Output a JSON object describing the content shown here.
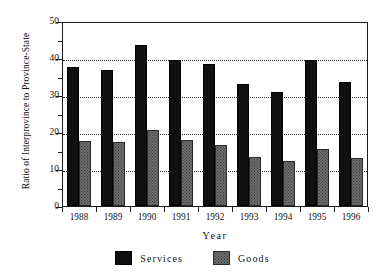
{
  "chart_data": {
    "type": "bar",
    "title": "",
    "xlabel": "Year",
    "ylabel": "Ratio of Interprovince to Province-State",
    "categories": [
      "1988",
      "1989",
      "1990",
      "1991",
      "1992",
      "1993",
      "1994",
      "1995",
      "1996"
    ],
    "series": [
      {
        "name": "Services",
        "color": "#101010",
        "values": [
          37.7,
          36.7,
          43.4,
          39.5,
          38.3,
          33.1,
          30.8,
          39.4,
          33.5
        ]
      },
      {
        "name": "Goods",
        "color": "#6d6d6d",
        "values": [
          17.6,
          17.3,
          20.5,
          17.8,
          16.4,
          13.3,
          12.3,
          15.4,
          12.9
        ]
      }
    ],
    "ylim": [
      0,
      50
    ],
    "yticks": [
      0,
      10,
      20,
      30,
      40,
      50
    ],
    "ytick_labels": [
      "0",
      "10",
      "20",
      "30",
      "40",
      "50"
    ],
    "yminor_ticks": [
      5,
      15,
      25,
      35,
      45
    ],
    "gridlines": [
      10,
      20,
      30,
      40
    ],
    "grid": true,
    "grid_style": "dotted",
    "legend_position": "bottom-center",
    "legend": [
      "Services",
      "Goods"
    ]
  }
}
